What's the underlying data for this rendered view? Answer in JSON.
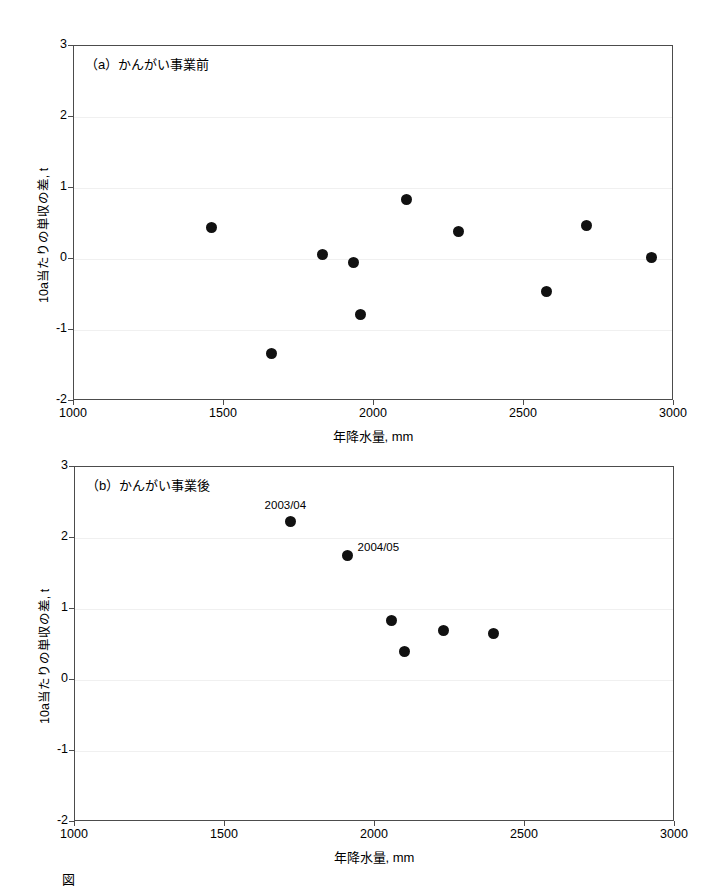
{
  "figure": {
    "caption_partial": "図　　　　　　　　　　　　　　　　　　　　　　　　　　"
  },
  "chart_data": [
    {
      "type": "scatter",
      "panel_id": "a",
      "title": "（a）かんがい事業前",
      "xlabel": "年降水量, mm",
      "ylabel": "10a当たりの単収の差, t",
      "xlim": [
        1000,
        3000
      ],
      "ylim": [
        -2,
        3
      ],
      "xticks": [
        1000,
        1500,
        2000,
        2500,
        3000
      ],
      "yticks": [
        -2,
        -1,
        0,
        1,
        2,
        3
      ],
      "xtick_labels": [
        "1000",
        "1500",
        "2000",
        "2500",
        "3000"
      ],
      "ytick_labels": [
        "-2",
        "-1",
        "0",
        "1",
        "2",
        "3"
      ],
      "grid": true,
      "marker": "filled-circle",
      "marker_color": "#111111",
      "points": [
        {
          "x": 1462,
          "y": 0.43
        },
        {
          "x": 1660,
          "y": -1.35
        },
        {
          "x": 1830,
          "y": 0.05
        },
        {
          "x": 1935,
          "y": -0.06
        },
        {
          "x": 1958,
          "y": -0.79
        },
        {
          "x": 2112,
          "y": 0.82
        },
        {
          "x": 2285,
          "y": 0.37
        },
        {
          "x": 2578,
          "y": -0.47
        },
        {
          "x": 2712,
          "y": 0.46
        },
        {
          "x": 2928,
          "y": 0.01
        }
      ]
    },
    {
      "type": "scatter",
      "panel_id": "b",
      "title": "（b）かんがい事業後",
      "xlabel": "年降水量, mm",
      "ylabel": "10a当たりの単収の差, t",
      "xlim": [
        1000,
        3000
      ],
      "ylim": [
        -2,
        3
      ],
      "xticks": [
        1000,
        1500,
        2000,
        2500,
        3000
      ],
      "yticks": [
        -2,
        -1,
        0,
        1,
        2,
        3
      ],
      "xtick_labels": [
        "1000",
        "1500",
        "2000",
        "2500",
        "3000"
      ],
      "ytick_labels": [
        "-2",
        "-1",
        "0",
        "1",
        "2",
        "3"
      ],
      "grid": true,
      "marker": "filled-circle",
      "marker_color": "#111111",
      "points": [
        {
          "x": 1722,
          "y": 2.22,
          "label": "2003/04",
          "label_pos": "above"
        },
        {
          "x": 1912,
          "y": 1.74,
          "label": "2004/05",
          "label_pos": "right"
        },
        {
          "x": 2058,
          "y": 0.83
        },
        {
          "x": 2100,
          "y": 0.39
        },
        {
          "x": 2230,
          "y": 0.68
        },
        {
          "x": 2398,
          "y": 0.64
        }
      ]
    }
  ]
}
